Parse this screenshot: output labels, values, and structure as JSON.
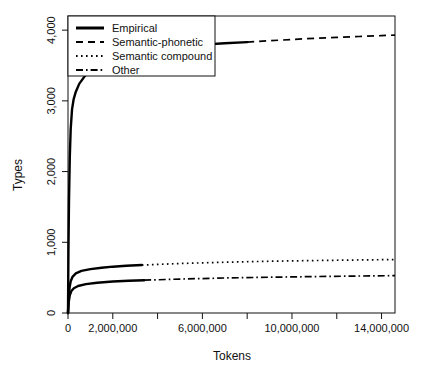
{
  "chart_data": {
    "type": "line",
    "title": "",
    "xlabel": "Tokens",
    "ylabel": "Types",
    "xlim": [
      0,
      14600000
    ],
    "ylim": [
      0,
      4200
    ],
    "grid": false,
    "legend_position": "top-left",
    "x_ticks": [
      0,
      2000000,
      4000000,
      6000000,
      8000000,
      10000000,
      12000000,
      14000000
    ],
    "x_tick_labels": [
      "0",
      "2,000,000",
      "",
      "6,000,000",
      "",
      "10,000,000",
      "",
      "14,000,000"
    ],
    "y_ticks": [
      0,
      1000,
      2000,
      3000,
      4000
    ],
    "y_tick_labels": [
      "0",
      "1,000",
      "2,000",
      "3,000",
      "4,000"
    ],
    "series": [
      {
        "name": "Empirical",
        "style": "solid",
        "role": "observed",
        "points": [
          [
            0,
            0
          ],
          [
            20000,
            900
          ],
          [
            45000,
            1600
          ],
          [
            80000,
            2200
          ],
          [
            120000,
            2600
          ],
          [
            180000,
            2880
          ],
          [
            250000,
            3020
          ],
          [
            350000,
            3130
          ],
          [
            500000,
            3240
          ],
          [
            750000,
            3350
          ],
          [
            1000000,
            3420
          ],
          [
            1500000,
            3520
          ],
          [
            2000000,
            3590
          ],
          [
            2500000,
            3640
          ],
          [
            3000000,
            3680
          ],
          [
            4000000,
            3730
          ],
          [
            5000000,
            3770
          ],
          [
            6000000,
            3795
          ],
          [
            7000000,
            3815
          ],
          [
            8000000,
            3830
          ]
        ]
      },
      {
        "name": "Semantic-phonetic",
        "style": "dashed",
        "role": "extrapolation",
        "points": [
          [
            8000000,
            3830
          ],
          [
            9000000,
            3850
          ],
          [
            10000000,
            3868
          ],
          [
            11000000,
            3884
          ],
          [
            12000000,
            3898
          ],
          [
            13000000,
            3910
          ],
          [
            14000000,
            3922
          ],
          [
            14600000,
            3930
          ]
        ]
      },
      {
        "name": "Semantic compound",
        "style": "dotted",
        "role": "extrapolation",
        "observed_points": [
          [
            0,
            0
          ],
          [
            30000,
            220
          ],
          [
            70000,
            360
          ],
          [
            120000,
            450
          ],
          [
            200000,
            510
          ],
          [
            350000,
            560
          ],
          [
            600000,
            595
          ],
          [
            1000000,
            620
          ],
          [
            1500000,
            640
          ],
          [
            2000000,
            655
          ],
          [
            2600000,
            668
          ],
          [
            3300000,
            678
          ]
        ],
        "points": [
          [
            3300000,
            678
          ],
          [
            5000000,
            700
          ],
          [
            7000000,
            718
          ],
          [
            9000000,
            732
          ],
          [
            11000000,
            742
          ],
          [
            13000000,
            750
          ],
          [
            14600000,
            756
          ]
        ]
      },
      {
        "name": "Other",
        "style": "dashdot",
        "role": "extrapolation",
        "observed_points": [
          [
            0,
            0
          ],
          [
            30000,
            150
          ],
          [
            80000,
            250
          ],
          [
            150000,
            310
          ],
          [
            260000,
            350
          ],
          [
            450000,
            382
          ],
          [
            800000,
            408
          ],
          [
            1300000,
            428
          ],
          [
            2000000,
            445
          ],
          [
            2700000,
            456
          ],
          [
            3400000,
            464
          ]
        ],
        "points": [
          [
            3400000,
            464
          ],
          [
            5000000,
            480
          ],
          [
            7000000,
            495
          ],
          [
            9000000,
            506
          ],
          [
            11000000,
            515
          ],
          [
            13000000,
            523
          ],
          [
            14600000,
            528
          ]
        ]
      }
    ],
    "legend_entries": [
      {
        "label": "Empirical",
        "style": "solid"
      },
      {
        "label": "Semantic-phonetic",
        "style": "dashed"
      },
      {
        "label": "Semantic compound",
        "style": "dotted"
      },
      {
        "label": "Other",
        "style": "dashdot"
      }
    ]
  }
}
